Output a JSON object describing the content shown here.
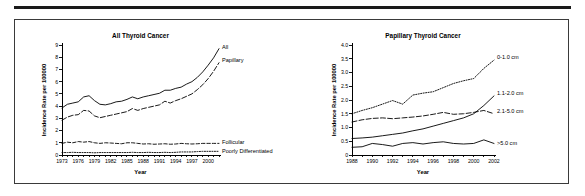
{
  "figure": {
    "background_color": "#ffffff",
    "ink_color": "#000000",
    "rule_color": "#1a1a1a",
    "border_color": "#3a3a3a"
  },
  "chart_data": [
    {
      "type": "line",
      "panel": "left",
      "title": "All Thyroid Cancer",
      "xlabel": "Year",
      "ylabel": "Incidence Rate per 100000",
      "xlim": [
        1973,
        2002
      ],
      "ylim": [
        0,
        9
      ],
      "grid": false,
      "legend_position": "inline-right",
      "xticks": [
        1973,
        1976,
        1979,
        1982,
        1985,
        1988,
        1991,
        1994,
        1997,
        2000
      ],
      "xtick_labels": [
        "1973",
        "1976",
        "1979",
        "1982",
        "1985",
        "1988",
        "1991",
        "1994",
        "1997",
        "2000"
      ],
      "xtick_minor_step": 1,
      "yticks": [
        0,
        1,
        2,
        3,
        4,
        5,
        6,
        7,
        8,
        9
      ],
      "ytick_labels": [
        "0",
        "1",
        "2",
        "3",
        "4",
        "5",
        "6",
        "7",
        "8",
        "9"
      ],
      "x": [
        1973,
        1974,
        1975,
        1976,
        1977,
        1978,
        1979,
        1980,
        1981,
        1982,
        1983,
        1984,
        1985,
        1986,
        1987,
        1988,
        1989,
        1990,
        1991,
        1992,
        1993,
        1994,
        1995,
        1996,
        1997,
        1998,
        1999,
        2000,
        2001,
        2002
      ],
      "series": [
        {
          "name": "All",
          "label": "All",
          "dash": "none",
          "label_x": 2002,
          "label_y": 8.85,
          "values": [
            3.85,
            4.15,
            4.25,
            4.35,
            4.75,
            4.85,
            4.45,
            4.15,
            4.1,
            4.2,
            4.35,
            4.4,
            4.55,
            4.75,
            4.6,
            4.75,
            4.85,
            4.95,
            5.05,
            5.3,
            5.3,
            5.45,
            5.55,
            5.8,
            6.0,
            6.35,
            6.8,
            7.35,
            7.95,
            8.7
          ]
        },
        {
          "name": "Papillary",
          "label": "Papillary",
          "dash": "long",
          "label_x": 2002,
          "label_y": 7.75,
          "values": [
            2.85,
            3.1,
            3.25,
            3.3,
            3.65,
            3.6,
            3.2,
            3.05,
            3.15,
            3.25,
            3.35,
            3.45,
            3.55,
            3.8,
            3.65,
            3.8,
            3.9,
            4.0,
            4.1,
            4.4,
            4.25,
            4.45,
            4.6,
            4.8,
            5.0,
            5.35,
            5.75,
            6.25,
            6.85,
            7.55
          ]
        },
        {
          "name": "Follicular",
          "label": "Follicular",
          "dash": "medium",
          "label_x": 2002,
          "label_y": 1.05,
          "values": [
            0.95,
            1.05,
            1.0,
            1.1,
            1.05,
            1.1,
            1.0,
            0.95,
            1.0,
            0.98,
            0.95,
            0.92,
            1.0,
            1.0,
            0.95,
            0.9,
            0.92,
            0.88,
            0.9,
            0.92,
            0.88,
            0.9,
            0.95,
            0.92,
            0.9,
            0.92,
            0.95,
            0.95,
            0.95,
            0.95
          ]
        },
        {
          "name": "Poorly Differentiated",
          "label": "Poorly Differentiated",
          "dash": "dotted",
          "label_x": 2002,
          "label_y": 0.35,
          "values": [
            0.2,
            0.2,
            0.22,
            0.2,
            0.2,
            0.2,
            0.18,
            0.2,
            0.2,
            0.2,
            0.2,
            0.2,
            0.2,
            0.22,
            0.2,
            0.2,
            0.22,
            0.2,
            0.2,
            0.22,
            0.2,
            0.22,
            0.25,
            0.25,
            0.25,
            0.28,
            0.3,
            0.3,
            0.3,
            0.3
          ]
        }
      ]
    },
    {
      "type": "line",
      "panel": "right",
      "title": "Papillary Thyroid Cancer",
      "xlabel": "Year",
      "ylabel": "Incidence Rate per 100000",
      "xlim": [
        1988,
        2002
      ],
      "ylim": [
        0,
        4.0
      ],
      "grid": false,
      "legend_position": "inline-right",
      "xticks": [
        1988,
        1990,
        1992,
        1994,
        1996,
        1998,
        2000,
        2002
      ],
      "xtick_labels": [
        "1988",
        "1990",
        "1992",
        "1994",
        "1996",
        "1998",
        "2000",
        "2002"
      ],
      "xtick_minor_step": 1,
      "yticks": [
        0,
        0.5,
        1.0,
        1.5,
        2.0,
        2.5,
        3.0,
        3.5,
        4.0
      ],
      "ytick_labels": [
        "0",
        "0.5",
        "1.0",
        "1.5",
        "2.0",
        "2.5",
        "3.0",
        "3.5",
        "4.0"
      ],
      "x": [
        1988,
        1989,
        1990,
        1991,
        1992,
        1993,
        1994,
        1995,
        1996,
        1997,
        1998,
        1999,
        2000,
        2001,
        2002
      ],
      "series": [
        {
          "name": "0-1.0 cm",
          "label": "0-1.0 cm",
          "dash": "dotted",
          "label_x": 2002,
          "label_y": 3.55,
          "values": [
            1.5,
            1.62,
            1.72,
            1.85,
            1.98,
            1.85,
            2.18,
            2.25,
            2.3,
            2.45,
            2.6,
            2.7,
            2.78,
            3.15,
            3.45
          ]
        },
        {
          "name": "1.1-2.0 cm",
          "label": "1.1-2.0 cm",
          "dash": "none",
          "label_x": 2002,
          "label_y": 2.25,
          "values": [
            0.6,
            0.62,
            0.65,
            0.7,
            0.75,
            0.8,
            0.88,
            0.95,
            1.05,
            1.15,
            1.25,
            1.35,
            1.5,
            1.8,
            2.15
          ]
        },
        {
          "name": "2.1-5.0 cm",
          "label": "2.1-5.0 cm",
          "dash": "long",
          "label_x": 2002,
          "label_y": 1.6,
          "values": [
            1.2,
            1.28,
            1.33,
            1.35,
            1.32,
            1.35,
            1.38,
            1.42,
            1.48,
            1.55,
            1.48,
            1.5,
            1.55,
            1.62,
            1.5
          ]
        },
        {
          "name": ">5.0 cm",
          "label": ">5.0 cm",
          "dash": "none",
          "label_x": 2002,
          "label_y": 0.45,
          "values": [
            0.28,
            0.3,
            0.42,
            0.38,
            0.32,
            0.42,
            0.45,
            0.4,
            0.45,
            0.48,
            0.42,
            0.4,
            0.42,
            0.55,
            0.42
          ]
        }
      ]
    }
  ]
}
